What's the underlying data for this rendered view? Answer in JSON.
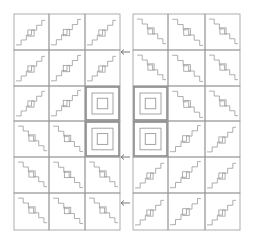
{
  "figure": {
    "line_color": "#9a9a9a",
    "highlight_color": "#8a8a8a",
    "background": "#ffffff"
  },
  "grid": {
    "rows": 6,
    "cols_per_half": 3,
    "row_lines": [
      14,
      50,
      86,
      121,
      157,
      193,
      230
    ],
    "left_col_lines": [
      14,
      49,
      85,
      120
    ],
    "right_col_lines": [
      133,
      168,
      205,
      240
    ]
  },
  "highlighted_cells": [
    {
      "half": "left",
      "row": 2,
      "col": 2
    },
    {
      "half": "left",
      "row": 3,
      "col": 2
    },
    {
      "half": "right",
      "row": 2,
      "col": 0
    },
    {
      "half": "right",
      "row": 3,
      "col": 0
    }
  ],
  "arrows": [
    {
      "y": 52,
      "direction": "left"
    },
    {
      "y": 157,
      "direction": "left"
    },
    {
      "y": 203,
      "direction": "left"
    }
  ]
}
